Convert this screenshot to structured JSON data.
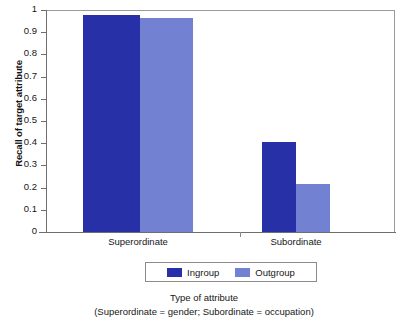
{
  "chart_data": {
    "type": "bar",
    "title": "",
    "subtitle": "",
    "xlabel": "Type of attribute",
    "xlabel_note": "(Superordinate = gender; Subordinate = occupation)",
    "ylabel": "Recall of target attribute",
    "ylim": [
      0,
      1
    ],
    "ytick_labels": [
      "1",
      "0.9",
      "0.8",
      "0.7",
      "0.6",
      "0.5",
      "0.4",
      "0.3",
      "0.2",
      "0.1",
      "0"
    ],
    "ytick_values": [
      1,
      0.9,
      0.8,
      0.7,
      0.6,
      0.5,
      0.4,
      0.3,
      0.2,
      0.1,
      0
    ],
    "categories": [
      "Superordinate",
      "Subordinate"
    ],
    "series": [
      {
        "name": "Ingroup",
        "color": "#2830a8",
        "values": [
          0.98,
          0.41
        ]
      },
      {
        "name": "Outgroup",
        "color": "#7381d2",
        "values": [
          0.97,
          0.22
        ]
      }
    ],
    "grid": false,
    "legend_position": "bottom",
    "legend_entries": [
      "Ingroup",
      "Outgroup"
    ]
  },
  "axis": {
    "y_title": "Recall of target attribute"
  },
  "caption": {
    "line1": "Type of attribute",
    "line2": "(Superordinate = gender; Subordinate = occupation)"
  }
}
